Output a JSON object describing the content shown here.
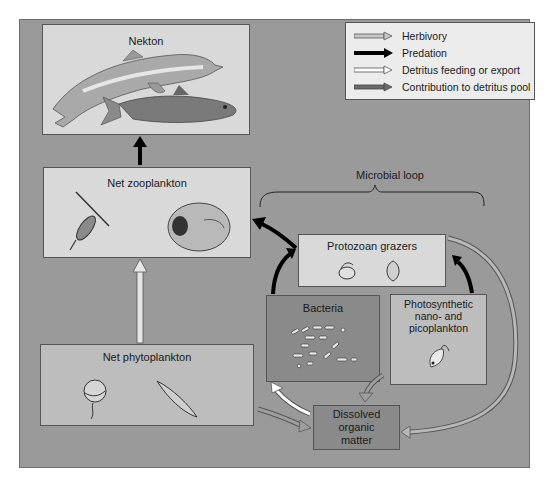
{
  "legend": {
    "items": [
      {
        "label": "Herbivory",
        "arrow": "gray-outlined"
      },
      {
        "label": "Predation",
        "arrow": "black-solid"
      },
      {
        "label": "Detritus feeding or export",
        "arrow": "white-outlined"
      },
      {
        "label": "Contribution to detritus pool",
        "arrow": "dark-gray-solid"
      }
    ]
  },
  "boxes": {
    "nekton": {
      "label": "Nekton",
      "illustrations": [
        "dolphin",
        "herring-fish"
      ]
    },
    "zooplankton": {
      "label": "Net zooplankton",
      "illustrations": [
        "copepod",
        "larval-organism"
      ]
    },
    "phytoplankton": {
      "label": "Net phytoplankton",
      "illustrations": [
        "dinoflagellate",
        "diatom"
      ]
    },
    "protozoan": {
      "label": "Protozoan grazers",
      "illustrations": [
        "ciliate",
        "flagellate"
      ]
    },
    "bacteria": {
      "label": "Bacteria",
      "illustrations": [
        "bacteria-cells"
      ]
    },
    "photosynthetic": {
      "line1": "Photosynthetic",
      "line2": "nano- and",
      "line3": "picoplankton",
      "illustrations": [
        "flagellate-cell"
      ]
    },
    "dom": {
      "line1": "Dissolved",
      "line2": "organic",
      "line3": "matter"
    }
  },
  "microbial_loop": {
    "label": "Microbial loop"
  },
  "colors": {
    "frame": "#9a9a9a",
    "light_box": "#d9d9d9",
    "mid_box": "#bdbdbd",
    "dark_box": "#8a8a8a",
    "predation": "#000000",
    "herbivory": "#c8c8c8",
    "detritus_feeding": "#ffffff",
    "detritus_pool": "#6a6a6a"
  }
}
